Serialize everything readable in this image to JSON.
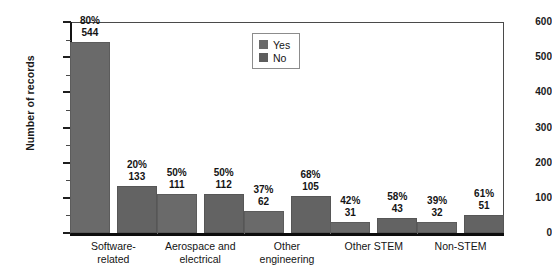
{
  "chart_data": {
    "type": "bar",
    "title": "",
    "xlabel": "",
    "ylabel": "Number of records",
    "ylim": [
      0,
      600
    ],
    "ytick_step": 100,
    "ytick_labels": [
      "600",
      "500",
      "400",
      "300",
      "200",
      "100",
      "0"
    ],
    "grid": false,
    "legend_position": "top-center",
    "categories": [
      "Software-related",
      "Aerospace and electrical",
      "Other engineering",
      "Other STEM",
      "Non-STEM"
    ],
    "category_lines": [
      [
        "Software-",
        "related"
      ],
      [
        "Aerospace and",
        "electrical"
      ],
      [
        "Other",
        "engineering"
      ],
      [
        "Other STEM",
        ""
      ],
      [
        "Non-STEM",
        ""
      ]
    ],
    "series": [
      {
        "name": "Yes",
        "color": "#6a6a6a",
        "values": [
          544,
          111,
          62,
          31,
          32
        ],
        "percent_labels": [
          "80%",
          "50%",
          "37%",
          "42%",
          "39%"
        ],
        "count_labels": [
          "544",
          "111",
          "62",
          "31",
          "32"
        ]
      },
      {
        "name": "No",
        "color": "#5e5e5e",
        "values": [
          133,
          112,
          105,
          43,
          51
        ],
        "percent_labels": [
          "20%",
          "50%",
          "68%",
          "58%",
          "61%"
        ],
        "count_labels": [
          "133",
          "112",
          "105",
          "43",
          "51"
        ]
      }
    ]
  },
  "legend": {
    "items": [
      {
        "label": "Yes",
        "color": "#6a6a6a"
      },
      {
        "label": "No",
        "color": "#5e5e5e"
      }
    ]
  },
  "axes": {
    "y_title": "Number of records"
  }
}
